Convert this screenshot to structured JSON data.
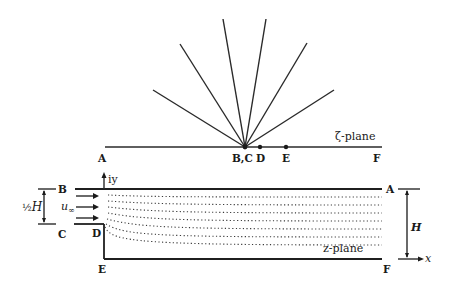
{
  "zeta_plane": {
    "title": "ζ-plane",
    "points": {
      "A": "A",
      "BC": "B,C",
      "D": "D",
      "E": "E",
      "F": "F"
    },
    "ray_count": 6
  },
  "z_plane": {
    "title": "z-plane",
    "points": {
      "A": "A",
      "B": "B",
      "C": "C",
      "D": "D",
      "E": "E",
      "F": "F"
    },
    "axis_y": "iy",
    "axis_x": "x",
    "inflow_velocity": "u",
    "inflow_subscript": "∞",
    "half_height_label": "½H",
    "half_frac": "½",
    "half_H": "H",
    "height_label": "H",
    "streamline_count": 7
  }
}
